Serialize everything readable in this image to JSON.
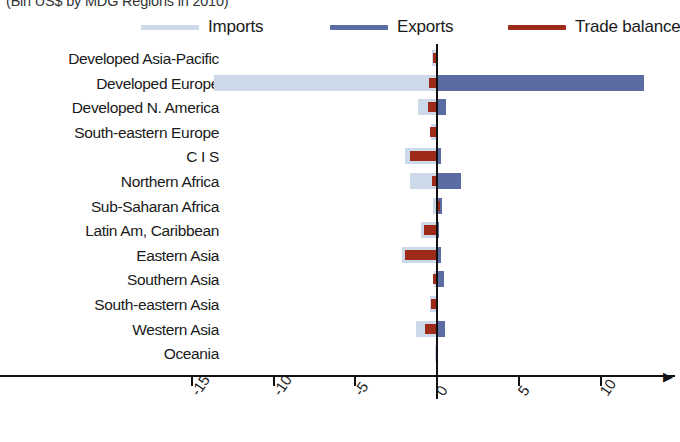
{
  "subtitle": "(Bln US$ by MDG Regions in 2010)",
  "legend": {
    "items": [
      {
        "label": "Imports",
        "color": "#ccd9e8",
        "icon": "line-swatch-icon"
      },
      {
        "label": "Exports",
        "color": "#5b6ca3",
        "icon": "line-swatch-icon"
      },
      {
        "label": "Trade balance",
        "color": "#9e2b1a",
        "icon": "line-swatch-icon"
      }
    ]
  },
  "axis": {
    "xticks": [
      "-15",
      "-10",
      "-5",
      "0",
      "5",
      "10"
    ],
    "xtick_values": [
      -15,
      -10,
      -5,
      0,
      5,
      10
    ],
    "xlim": [
      -16.2,
      13.5
    ],
    "xlabel": "",
    "ylabel": ""
  },
  "chart_data": {
    "type": "bar",
    "orientation": "horizontal",
    "title": "",
    "subtitle": "(Bln US$ by MDG Regions in 2010)",
    "xlabel": "",
    "ylabel": "",
    "xlim": [
      -16.2,
      13.5
    ],
    "grid": false,
    "legend_position": "top",
    "categories": [
      "Developed Asia-Pacific",
      "Developed Europe",
      "Developed N. America",
      "South-eastern Europe",
      "C I S",
      "Northern Africa",
      "Sub-Saharan Africa",
      "Latin Am, Caribbean",
      "Eastern Asia",
      "Southern Asia",
      "South-eastern Asia",
      "Western Asia",
      "Oceania"
    ],
    "series": [
      {
        "name": "Imports",
        "color": "#ccd9e8",
        "values": [
          -0.25,
          -13.6,
          -1.1,
          -0.3,
          -1.9,
          -1.6,
          -0.2,
          -0.9,
          -2.1,
          -0.15,
          -0.35,
          -1.2,
          -0.05
        ]
      },
      {
        "name": "Exports",
        "color": "#5b6ca3",
        "values": [
          0.1,
          12.7,
          0.6,
          0.15,
          0.3,
          1.55,
          0.35,
          0.2,
          0.3,
          0.5,
          0.1,
          0.55,
          0.03
        ]
      },
      {
        "name": "Trade balance",
        "color": "#9e2b1a",
        "values": [
          -0.2,
          -0.45,
          -0.5,
          -0.35,
          -1.6,
          -0.25,
          0.25,
          -0.75,
          -1.9,
          -0.2,
          -0.3,
          -0.7,
          -0.02
        ]
      }
    ]
  }
}
